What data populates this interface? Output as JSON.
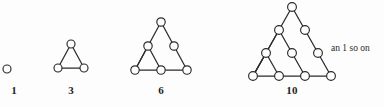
{
  "figure": {
    "width": 384,
    "height": 107,
    "background_color": "#fdfdfd",
    "ink_color": "#2b2b2b",
    "note": {
      "text": "an 1 so on",
      "x": 331,
      "y": 43
    }
  },
  "chart_data": {
    "type": "diagram",
    "sequence_values": [
      1,
      3,
      6,
      10
    ],
    "groups": [
      {
        "label": "1",
        "rows": 1,
        "dot_count": 1,
        "label_x": 14,
        "label_y": 84,
        "nodes": [
          {
            "x": 7,
            "y": 69,
            "r": 4.0
          }
        ],
        "edges": [],
        "nested_triangles": 0
      },
      {
        "label": "3",
        "rows": 2,
        "dot_count": 3,
        "label_x": 71,
        "label_y": 84,
        "nodes": [
          {
            "x": 71,
            "y": 44,
            "r": 4.0
          },
          {
            "x": 58,
            "y": 68,
            "r": 4.0
          },
          {
            "x": 84,
            "y": 68,
            "r": 4.0
          }
        ],
        "edges": [
          {
            "x1": 71,
            "y1": 44,
            "x2": 58,
            "y2": 68
          },
          {
            "x1": 71,
            "y1": 44,
            "x2": 84,
            "y2": 68
          },
          {
            "x1": 58,
            "y1": 68,
            "x2": 84,
            "y2": 68
          }
        ],
        "nested_triangles": 1
      },
      {
        "label": "6",
        "rows": 3,
        "dot_count": 6,
        "label_x": 161,
        "label_y": 84,
        "nodes": [
          {
            "x": 161,
            "y": 22,
            "r": 4.2
          },
          {
            "x": 148,
            "y": 46,
            "r": 4.2
          },
          {
            "x": 174,
            "y": 46,
            "r": 4.2
          },
          {
            "x": 135,
            "y": 70,
            "r": 4.2
          },
          {
            "x": 161,
            "y": 70,
            "r": 4.2
          },
          {
            "x": 187,
            "y": 70,
            "r": 4.2
          }
        ],
        "edges": [
          {
            "x1": 161,
            "y1": 22,
            "x2": 135,
            "y2": 70
          },
          {
            "x1": 161,
            "y1": 22,
            "x2": 187,
            "y2": 70
          },
          {
            "x1": 135,
            "y1": 70,
            "x2": 187,
            "y2": 70
          },
          {
            "x1": 148,
            "y1": 46,
            "x2": 135,
            "y2": 70
          },
          {
            "x1": 148,
            "y1": 46,
            "x2": 161,
            "y2": 70
          }
        ],
        "nested_triangles": 2
      },
      {
        "label": "10",
        "rows": 4,
        "dot_count": 10,
        "label_x": 292,
        "label_y": 84,
        "nodes": [
          {
            "x": 292,
            "y": 7,
            "r": 4.4
          },
          {
            "x": 279,
            "y": 30,
            "r": 4.4
          },
          {
            "x": 305,
            "y": 30,
            "r": 4.4
          },
          {
            "x": 266,
            "y": 53,
            "r": 4.4
          },
          {
            "x": 292,
            "y": 53,
            "r": 4.4
          },
          {
            "x": 318,
            "y": 53,
            "r": 4.4
          },
          {
            "x": 253,
            "y": 76,
            "r": 4.4
          },
          {
            "x": 279,
            "y": 76,
            "r": 4.4
          },
          {
            "x": 305,
            "y": 76,
            "r": 4.4
          },
          {
            "x": 331,
            "y": 76,
            "r": 4.4
          }
        ],
        "edges": [
          {
            "x1": 292,
            "y1": 7,
            "x2": 253,
            "y2": 76
          },
          {
            "x1": 292,
            "y1": 7,
            "x2": 331,
            "y2": 76
          },
          {
            "x1": 253,
            "y1": 76,
            "x2": 331,
            "y2": 76
          },
          {
            "x1": 279,
            "y1": 30,
            "x2": 253,
            "y2": 76
          },
          {
            "x1": 279,
            "y1": 30,
            "x2": 305,
            "y2": 76
          },
          {
            "x1": 266,
            "y1": 53,
            "x2": 253,
            "y2": 76
          },
          {
            "x1": 266,
            "y1": 53,
            "x2": 279,
            "y2": 76
          }
        ],
        "nested_triangles": 3
      }
    ]
  }
}
